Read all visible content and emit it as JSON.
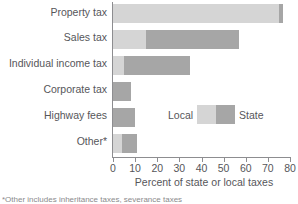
{
  "chart_data": {
    "type": "bar",
    "orientation": "horizontal",
    "stacked": true,
    "title": "",
    "xlabel": "Percent of state or local taxes",
    "ylabel": "",
    "xlim": [
      0,
      80
    ],
    "xticks": [
      0,
      10,
      20,
      30,
      40,
      50,
      60,
      70,
      80
    ],
    "xtick_labels": [
      "0",
      "10",
      "20",
      "30",
      "40",
      "50",
      "60",
      "70",
      "80"
    ],
    "grid": false,
    "legend_position": "inside-right",
    "categories": [
      "Property tax",
      "Sales tax",
      "Individual income tax",
      "Corporate tax",
      "Highway fees",
      "Other*"
    ],
    "series": [
      {
        "name": "Local",
        "color": "#d5d5d5",
        "values": [
          75,
          15,
          5,
          0,
          0,
          4
        ]
      },
      {
        "name": "State",
        "color": "#a6a6a6",
        "values": [
          2,
          42,
          30,
          8,
          10,
          7
        ]
      }
    ],
    "totals": [
      77,
      57,
      35,
      8,
      10,
      11
    ],
    "annotations": []
  },
  "legend": {
    "local_label": "Local",
    "state_label": "State"
  },
  "footnote": {
    "text": "*Other includes inheritance taxes, severance taxes"
  }
}
